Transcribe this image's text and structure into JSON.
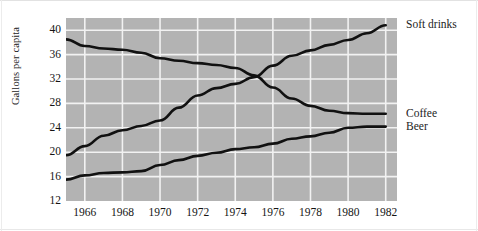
{
  "figure": {
    "background_color": "#ffffff",
    "plot_background_color": "#b3b3b3",
    "gridline_color": "#f2f2f2",
    "line_color": "#111111"
  },
  "chart_data": {
    "type": "line",
    "title": "",
    "xlabel": "",
    "ylabel": "Gallons per capita",
    "xlim": [
      1965,
      1982.6
    ],
    "ylim": [
      12,
      42
    ],
    "grid": true,
    "legend_position": "right-of-axes-at-line-end",
    "xticks": [
      1966,
      1968,
      1970,
      1972,
      1974,
      1976,
      1978,
      1980,
      1982
    ],
    "yticks": [
      12,
      16,
      20,
      24,
      28,
      32,
      36,
      40
    ],
    "x": [
      1965,
      1966,
      1967,
      1968,
      1969,
      1970,
      1971,
      1972,
      1973,
      1974,
      1975,
      1976,
      1977,
      1978,
      1979,
      1980,
      1981,
      1982
    ],
    "series": [
      {
        "name": "Soft drinks",
        "label": "Soft drinks",
        "color": "#111111",
        "values": [
          19.5,
          21.0,
          22.7,
          23.6,
          24.3,
          25.2,
          27.3,
          29.3,
          30.5,
          31.2,
          32.3,
          34.2,
          35.8,
          36.7,
          37.6,
          38.4,
          39.5,
          40.8
        ]
      },
      {
        "name": "Coffee",
        "label": "Coffee",
        "color": "#111111",
        "values": [
          38.5,
          37.4,
          37.0,
          36.8,
          36.3,
          35.4,
          35.0,
          34.6,
          34.3,
          33.8,
          32.6,
          30.6,
          28.8,
          27.6,
          26.8,
          26.4,
          26.3,
          26.3
        ]
      },
      {
        "name": "Beer",
        "label": "Beer",
        "color": "#111111",
        "values": [
          15.5,
          16.2,
          16.6,
          16.7,
          16.9,
          17.9,
          18.7,
          19.4,
          19.9,
          20.5,
          20.8,
          21.4,
          22.2,
          22.6,
          23.2,
          24.0,
          24.2,
          24.2
        ]
      }
    ]
  }
}
